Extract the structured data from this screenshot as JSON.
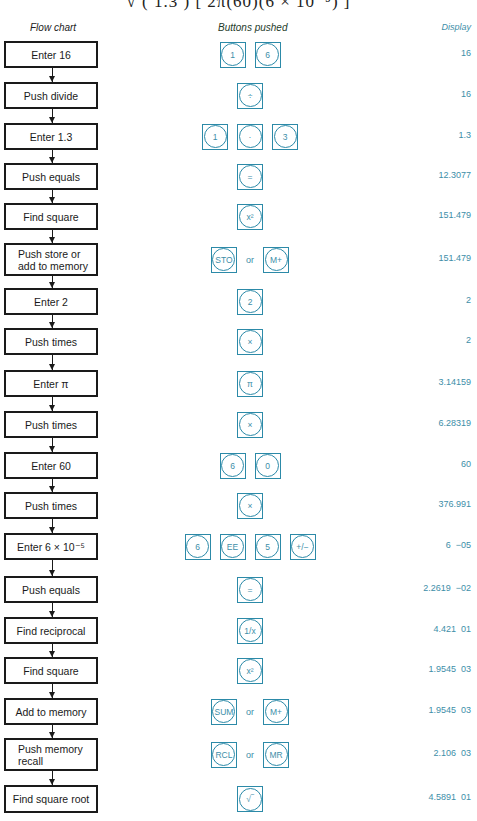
{
  "formula_fragment": "√ ( 1.3 )      [ 2π(60)(6 × 10⁻⁵) ]",
  "headers": {
    "flow": "Flow chart",
    "buttons": "Buttons pushed",
    "display": "Display"
  },
  "accent_color": "#2c8aa8",
  "steps": [
    {
      "label": "Enter 16",
      "keys": [
        "1",
        "6"
      ],
      "or": false,
      "display": "16",
      "top": 41,
      "h": 27
    },
    {
      "label": "Push divide",
      "keys": [
        "÷"
      ],
      "or": false,
      "display": "16",
      "top": 82,
      "h": 27
    },
    {
      "label": "Enter 1.3",
      "keys": [
        "1",
        "·",
        "3"
      ],
      "or": false,
      "display": "1.3",
      "top": 123,
      "h": 27
    },
    {
      "label": "Push equals",
      "keys": [
        "="
      ],
      "or": false,
      "display": "12.3077",
      "top": 163,
      "h": 27
    },
    {
      "label": "Find square",
      "keys": [
        "x²"
      ],
      "or": false,
      "display": "151.479",
      "top": 203,
      "h": 27
    },
    {
      "label": "Push store or add to memory",
      "keys": [
        "STO",
        "M+"
      ],
      "or": true,
      "display": "151.479",
      "top": 243,
      "h": 33,
      "left": true
    },
    {
      "label": "Enter 2",
      "keys": [
        "2"
      ],
      "or": false,
      "display": "2",
      "top": 288,
      "h": 27
    },
    {
      "label": "Push times",
      "keys": [
        "×"
      ],
      "or": false,
      "display": "2",
      "top": 328,
      "h": 27
    },
    {
      "label": "Enter π",
      "keys": [
        "π"
      ],
      "or": false,
      "display": "3.14159",
      "top": 370,
      "h": 27
    },
    {
      "label": "Push times",
      "keys": [
        "×"
      ],
      "or": false,
      "display": "6.28319",
      "top": 411,
      "h": 27
    },
    {
      "label": "Enter 60",
      "keys": [
        "6",
        "0"
      ],
      "or": false,
      "display": "60",
      "top": 452,
      "h": 27
    },
    {
      "label": "Push times",
      "keys": [
        "×"
      ],
      "or": false,
      "display": "376.991",
      "top": 492,
      "h": 27
    },
    {
      "label": "Enter 6 × 10⁻⁵",
      "keys": [
        "6",
        "EE",
        "5",
        "+/−"
      ],
      "or": false,
      "display": "6  −05",
      "top": 533,
      "h": 27
    },
    {
      "label": "Push equals",
      "keys": [
        "="
      ],
      "or": false,
      "display": "2.2619  −02",
      "top": 576,
      "h": 27
    },
    {
      "label": "Find reciprocal",
      "keys": [
        "1/x"
      ],
      "or": false,
      "display": "4.421  01",
      "top": 617,
      "h": 27
    },
    {
      "label": "Find square",
      "keys": [
        "x²"
      ],
      "or": false,
      "display": "1.9545  03",
      "top": 657,
      "h": 27
    },
    {
      "label": "Add to memory",
      "keys": [
        "SUM",
        "M+"
      ],
      "or": true,
      "display": "1.9545  03",
      "top": 698,
      "h": 27
    },
    {
      "label": "Push memory recall",
      "keys": [
        "RCL",
        "MR"
      ],
      "or": true,
      "display": "2.106  03",
      "top": 738,
      "h": 33,
      "left": true
    },
    {
      "label": "Find square root",
      "keys": [
        "√‾"
      ],
      "or": false,
      "display": "4.5891  01",
      "top": 785,
      "h": 28
    }
  ],
  "or_label": "or"
}
